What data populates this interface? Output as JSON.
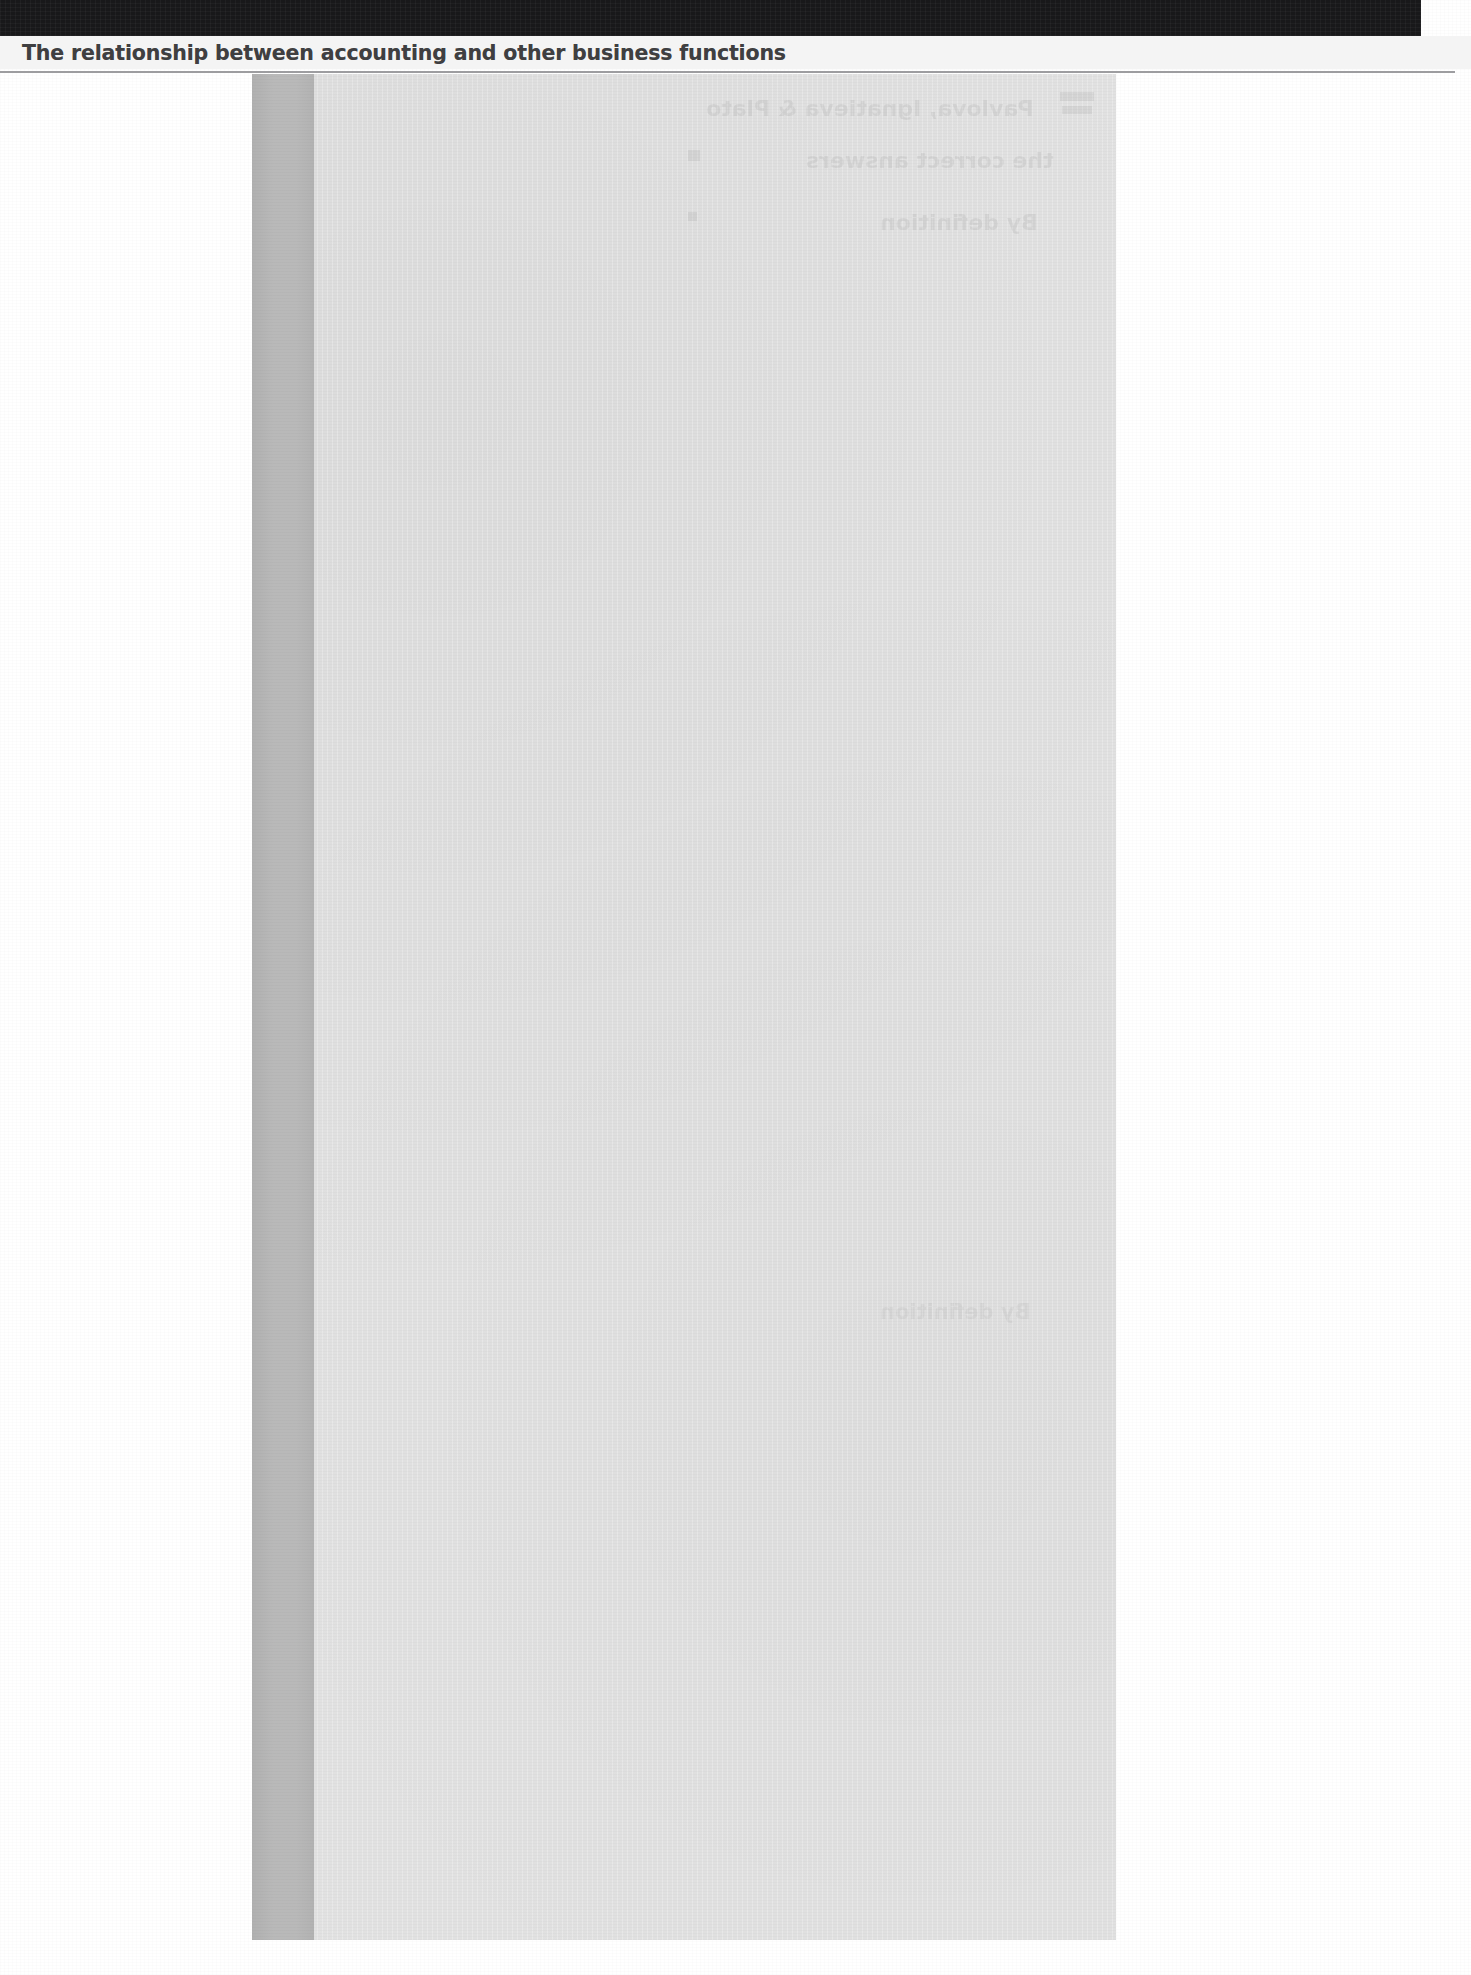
{
  "page": {
    "width": 1471,
    "height": 1975,
    "background_color": "#ffffff",
    "paper_tone": "#f7f7f7"
  },
  "header": {
    "black_bar_color": "#18181a",
    "running_head": "The relationship between accounting and other business functions",
    "rule_color": "#9d9da0",
    "band_color": "#f4f4f4"
  },
  "body": {
    "content_panel": {
      "label": "scanned-content-block",
      "fill_color": "#e2e2e2"
    },
    "spine_bar": {
      "label": "page-gutter-shadow-bar",
      "fill_color": "#b9b9b9"
    }
  },
  "show_through": {
    "note": "faint mirrored text bleeding through from the reverse side of the sheet",
    "lines": [
      "Pavlova, Ignatieva & Plato",
      "the correct answers",
      "By definition",
      "By definition"
    ]
  }
}
